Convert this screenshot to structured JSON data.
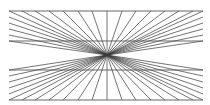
{
  "figure": {
    "type": "hering-illusion",
    "background": "#ffffff",
    "line_color": "#3a3a3a",
    "center": [
      107,
      55
    ],
    "frame": {
      "left": 9,
      "right": 203,
      "top": 11,
      "bottom": 100
    },
    "horizontal_lines_y": [
      11,
      41,
      70,
      100
    ],
    "ray_targets_top_x": [
      22,
      35,
      49,
      63,
      78,
      92,
      107,
      122,
      136,
      151,
      165,
      179,
      193
    ],
    "ray_targets_bottom_x": [
      22,
      35,
      49,
      63,
      78,
      92,
      107,
      122,
      136,
      151,
      165,
      179,
      193
    ],
    "ray_targets_side_y": [
      11,
      17,
      23,
      29,
      35,
      41,
      70,
      76,
      82,
      88,
      94,
      100
    ]
  }
}
